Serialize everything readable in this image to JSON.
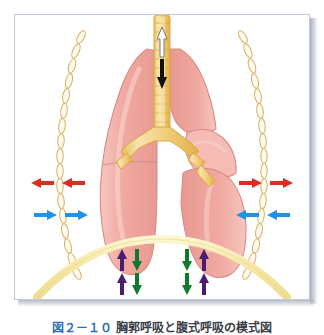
{
  "figure": {
    "title_region": "framed anatomical illustration of lungs, trachea, ribs and diaphragm",
    "caption": {
      "figure_number": "図２－１０",
      "text": "胸郭呼吸と腹式呼吸の模式図",
      "visible": "clipped"
    },
    "colors": {
      "frame_border": "#c3c7dd",
      "panel_background": "#ffffff",
      "lung_fill": "#f0a9a1",
      "lung_fill_light": "#f7c9c3",
      "lung_outline": "#d98b84",
      "trachea_fill": "#f2cf7c",
      "trachea_outline": "#d8a93f",
      "rib_outline": "#d7b05a",
      "diaphragm": "#f6e8a8",
      "arrow_red": "#d8301f",
      "arrow_blue": "#1e93e8",
      "arrow_purple": "#4b1d6e",
      "arrow_green": "#0f7a2e",
      "arrow_black": "#111111",
      "arrow_white": "#ffffff"
    },
    "structures": [
      {
        "name": "trachea",
        "label": "trachea with cartilage rings"
      },
      {
        "name": "bronchi",
        "label": "bifurcating main bronchi"
      },
      {
        "name": "left-lung",
        "label": "lung (viewer left)"
      },
      {
        "name": "right-lung",
        "label": "lung (viewer right), lobes displaced"
      },
      {
        "name": "ribs-left",
        "label": "rib chain, viewer left"
      },
      {
        "name": "ribs-right",
        "label": "rib chain, viewer right"
      },
      {
        "name": "diaphragm",
        "label": "diaphragm arc"
      },
      {
        "name": "diaphragm-dotted",
        "label": "alternate diaphragm position, dotted"
      }
    ],
    "arrows": {
      "airflow": [
        {
          "name": "airflow-in-arrow",
          "color": "#ffffff",
          "direction": "up",
          "meaning": "expiration airflow out of trachea"
        },
        {
          "name": "airflow-out-arrow",
          "color": "#111111",
          "direction": "down",
          "meaning": "inspiration airflow into trachea"
        }
      ],
      "thoracic": [
        {
          "name": "rib-arrow-red-left-inner",
          "color": "#d8301f",
          "direction": "left",
          "side": "left"
        },
        {
          "name": "rib-arrow-red-left-outer",
          "color": "#d8301f",
          "direction": "left",
          "side": "left"
        },
        {
          "name": "rib-arrow-blue-left-inner",
          "color": "#1e93e8",
          "direction": "right",
          "side": "left"
        },
        {
          "name": "rib-arrow-blue-left-outer",
          "color": "#1e93e8",
          "direction": "right",
          "side": "left"
        },
        {
          "name": "rib-arrow-red-right-inner",
          "color": "#d8301f",
          "direction": "right",
          "side": "right"
        },
        {
          "name": "rib-arrow-red-right-outer",
          "color": "#d8301f",
          "direction": "right",
          "side": "right"
        },
        {
          "name": "rib-arrow-blue-right-inner",
          "color": "#1e93e8",
          "direction": "left",
          "side": "right"
        },
        {
          "name": "rib-arrow-blue-right-outer",
          "color": "#1e93e8",
          "direction": "left",
          "side": "right"
        }
      ],
      "diaphragmatic": [
        {
          "name": "diaphragm-arrow-purple-up-left-upper",
          "color": "#4b1d6e",
          "direction": "up"
        },
        {
          "name": "diaphragm-arrow-green-down-left-upper",
          "color": "#0f7a2e",
          "direction": "down"
        },
        {
          "name": "diaphragm-arrow-purple-up-left-lower",
          "color": "#4b1d6e",
          "direction": "up"
        },
        {
          "name": "diaphragm-arrow-green-down-left-lower",
          "color": "#0f7a2e",
          "direction": "down"
        },
        {
          "name": "diaphragm-arrow-green-down-right-upper",
          "color": "#0f7a2e",
          "direction": "down"
        },
        {
          "name": "diaphragm-arrow-purple-up-right-upper",
          "color": "#4b1d6e",
          "direction": "up"
        },
        {
          "name": "diaphragm-arrow-green-down-right-lower",
          "color": "#0f7a2e",
          "direction": "down"
        },
        {
          "name": "diaphragm-arrow-purple-up-right-lower",
          "color": "#4b1d6e",
          "direction": "up"
        }
      ]
    }
  }
}
